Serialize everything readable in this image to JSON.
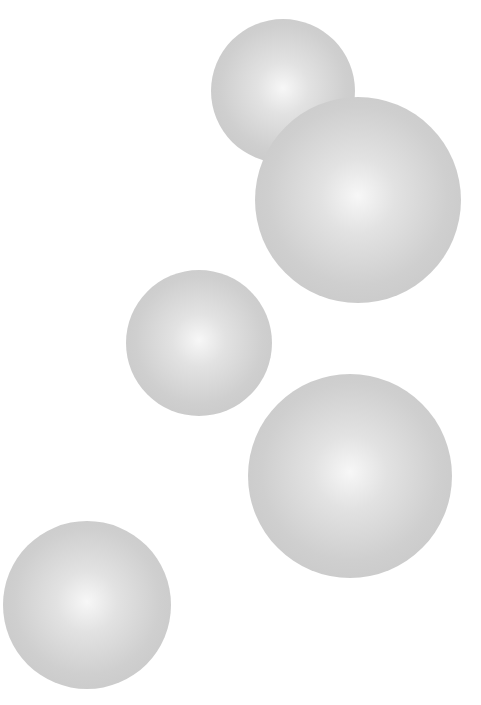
{
  "scene": {
    "background": "#ffffff",
    "spheres": [
      {
        "cx": 283,
        "cy": 91,
        "r": 72
      },
      {
        "cx": 358,
        "cy": 200,
        "r": 103
      },
      {
        "cx": 199,
        "cy": 343,
        "r": 73
      },
      {
        "cx": 350,
        "cy": 476,
        "r": 102
      },
      {
        "cx": 87,
        "cy": 605,
        "r": 84
      }
    ]
  }
}
